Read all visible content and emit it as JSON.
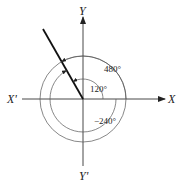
{
  "diagram": {
    "type": "angle-diagram",
    "axes": {
      "x_pos_label": "X",
      "x_neg_label": "X'",
      "y_pos_label": "Y",
      "y_neg_label": "Y'"
    },
    "terminal_side_angle_deg": 120,
    "angles": [
      {
        "label": "120°",
        "value": 120,
        "direction": "counterclockwise"
      },
      {
        "label": "480°",
        "value": 480,
        "direction": "counterclockwise"
      },
      {
        "label": "−240°",
        "value": -240,
        "direction": "clockwise"
      }
    ],
    "colors": {
      "line": "#222222",
      "arc": "#555555",
      "background": "#ffffff"
    }
  }
}
